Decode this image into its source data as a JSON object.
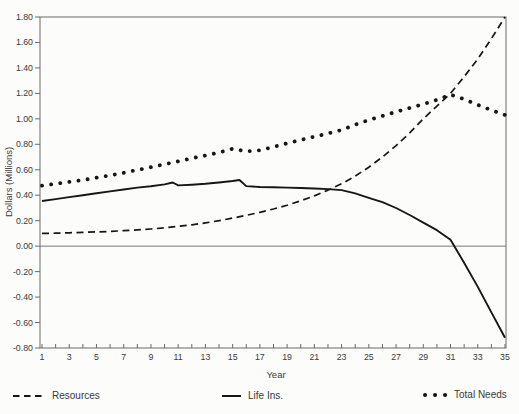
{
  "figure": {
    "background": "#fcfcfa",
    "ink_color": "#161616",
    "frame_color": "#6a6a6a",
    "text_color": "#3a3a3a"
  },
  "chart_data": {
    "type": "line",
    "title": "",
    "xlabel": "Year",
    "ylabel": "Dollars (Millions)",
    "xlim": [
      1,
      35
    ],
    "ylim": [
      -0.8,
      1.8
    ],
    "y_tick_step": 0.2,
    "y_tick_labels": [
      "1.80",
      "1.60",
      "1.40",
      "1.20",
      "1.00",
      "0.80",
      "0.60",
      "0.40",
      "0.20",
      "0.00",
      "-0.20",
      "-0.40",
      "-0.60",
      "-0.80"
    ],
    "x_tick_minor_every": 1,
    "x_tick_labels": [
      1,
      3,
      5,
      7,
      9,
      11,
      13,
      15,
      17,
      19,
      21,
      23,
      25,
      27,
      29,
      31,
      33,
      35
    ],
    "grid": false,
    "zero_line": true,
    "legend_position": "bottom",
    "series": [
      {
        "name": "Resources",
        "style": "dashed",
        "x": [
          1,
          2,
          3,
          4,
          5,
          6,
          7,
          8,
          9,
          10,
          11,
          12,
          13,
          14,
          15,
          16,
          17,
          18,
          19,
          20,
          21,
          22,
          23,
          24,
          25,
          26,
          27,
          28,
          29,
          30,
          31,
          32,
          33,
          34,
          35
        ],
        "values": [
          0.1,
          0.102,
          0.105,
          0.108,
          0.112,
          0.116,
          0.121,
          0.128,
          0.135,
          0.144,
          0.155,
          0.168,
          0.183,
          0.2,
          0.22,
          0.242,
          0.266,
          0.292,
          0.321,
          0.356,
          0.395,
          0.44,
          0.49,
          0.55,
          0.62,
          0.7,
          0.79,
          0.89,
          1.0,
          1.1,
          1.2,
          1.33,
          1.47,
          1.63,
          1.8
        ]
      },
      {
        "name": "Life Ins.",
        "style": "solid",
        "x": [
          1,
          2,
          3,
          4,
          5,
          6,
          7,
          8,
          9,
          10,
          10.6,
          11,
          12,
          13,
          14,
          15,
          15.5,
          16,
          17,
          18,
          19,
          20,
          21,
          22,
          23,
          24,
          25,
          26,
          27,
          28,
          29,
          30,
          31,
          32,
          33,
          34,
          35
        ],
        "values": [
          0.355,
          0.37,
          0.385,
          0.4,
          0.415,
          0.43,
          0.445,
          0.46,
          0.47,
          0.485,
          0.5,
          0.477,
          0.483,
          0.49,
          0.5,
          0.512,
          0.52,
          0.472,
          0.465,
          0.462,
          0.46,
          0.457,
          0.453,
          0.448,
          0.44,
          0.415,
          0.38,
          0.345,
          0.3,
          0.245,
          0.185,
          0.125,
          0.05,
          -0.13,
          -0.32,
          -0.52,
          -0.72
        ]
      },
      {
        "name": "Total Needs",
        "style": "dotted",
        "x": [
          1,
          2,
          3,
          4,
          5,
          6,
          7,
          8,
          9,
          10,
          11,
          12,
          13,
          14,
          15,
          16,
          17,
          18,
          19,
          20,
          21,
          22,
          23,
          24,
          25,
          26,
          27,
          28,
          29,
          30,
          31,
          32,
          33,
          34,
          35
        ],
        "values": [
          0.475,
          0.49,
          0.505,
          0.52,
          0.538,
          0.556,
          0.576,
          0.598,
          0.62,
          0.644,
          0.666,
          0.69,
          0.712,
          0.735,
          0.765,
          0.745,
          0.752,
          0.78,
          0.808,
          0.834,
          0.86,
          0.885,
          0.912,
          0.955,
          0.99,
          1.022,
          1.055,
          1.085,
          1.115,
          1.15,
          1.19,
          1.155,
          1.11,
          1.068,
          1.03
        ]
      }
    ]
  }
}
